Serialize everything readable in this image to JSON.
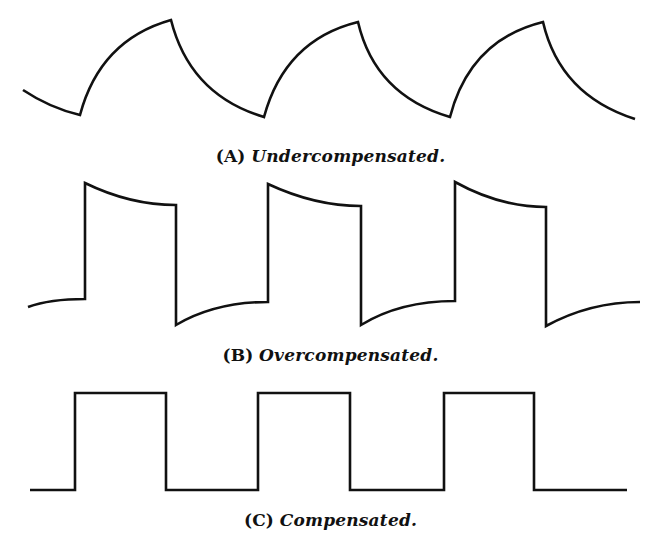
{
  "figure": {
    "panels": [
      {
        "id": "A",
        "label": "(A)",
        "caption": "Undercompensated.",
        "description": "Square wave with exponential (rounded) rise and fall, insufficient high-frequency response",
        "path": "M23,90 Q50,108 80,115 Q100,40 171,20 Q190,95 264,117 Q285,40 358,22 Q375,95 450,117 Q470,40 543,22 Q560,95 635,119"
      },
      {
        "id": "B",
        "label": "(B)",
        "caption": "Overcompensated.",
        "description": "Square wave with overshoot spikes at each edge, decaying toward level",
        "path": "M28,307 Q50,299 85,299 L85,183 Q130,205 176,205 L176,325 Q215,302 268,302 L268,184 Q315,206 361,206 L361,325 Q400,301 455,301 L455,182 Q500,207 546,207 L546,326 Q590,302 640,302"
      },
      {
        "id": "C",
        "label": "(C)",
        "caption": "Compensated.",
        "description": "Ideal square wave with flat tops and sharp edges",
        "path": "M30,490 L75,490 L75,393 L166,393 L166,490 L258,490 L258,393 L350,393 L350,490 L444,490 L444,393 L534,393 L534,490 L627,490"
      }
    ],
    "stroke_color": "#111111",
    "background_color": "#ffffff"
  }
}
